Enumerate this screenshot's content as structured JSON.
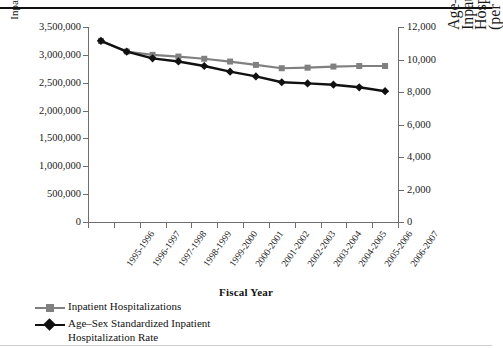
{
  "chart_data": {
    "type": "line",
    "title": "",
    "xlabel": "Fiscal Year",
    "ylabel": "Inpatient Hospitalizations",
    "ylabel_right": "Age–Sex Standardized Inpatient Hospitalization Rate (per 100,000 Population)",
    "categories": [
      "1995-1996",
      "1996-1997",
      "1997-1998",
      "1998-1999",
      "1999-2000",
      "2000-2001",
      "2001-2002",
      "2002-2003",
      "2003-2004",
      "2004-2005",
      "2005-2006",
      "2006-2007"
    ],
    "ylim": [
      0,
      3500000
    ],
    "yticks": [
      0,
      500000,
      1000000,
      1500000,
      2000000,
      2500000,
      3000000,
      3500000
    ],
    "ytick_labels": [
      "0",
      "500,000",
      "1,000,000",
      "1,500,000",
      "2,000,000",
      "2,500,000",
      "3,000,000",
      "3,500,000"
    ],
    "ylim_right": [
      0,
      12000
    ],
    "yticks_right": [
      0,
      2000,
      4000,
      6000,
      8000,
      10000,
      12000
    ],
    "ytick_labels_right": [
      "0",
      "2,000",
      "4,000",
      "6,000",
      "8,000",
      "10,000",
      "12,000"
    ],
    "grid": false,
    "legend_position": "bottom-left",
    "series": [
      {
        "name": "Inpatient Hospitalizations",
        "axis": "left",
        "color": "#808080",
        "marker": "square",
        "values": [
          3250000,
          3060000,
          3000000,
          2970000,
          2930000,
          2880000,
          2820000,
          2760000,
          2770000,
          2790000,
          2800000,
          2800000
        ]
      },
      {
        "name": "Age–Sex Standardized Inpatient Hospitalization Rate",
        "axis": "right",
        "color": "#111111",
        "marker": "diamond",
        "values": [
          11150,
          10480,
          10070,
          9880,
          9600,
          9250,
          8960,
          8600,
          8530,
          8450,
          8290,
          8050
        ]
      }
    ]
  },
  "legend": {
    "items": [
      {
        "label": "Inpatient Hospitalizations",
        "color": "#808080",
        "marker": "square"
      },
      {
        "label": "Age–Sex Standardized Inpatient",
        "label2": "Hospitalization Rate",
        "color": "#111111",
        "marker": "diamond"
      }
    ]
  },
  "axes": {
    "x_title": "Fiscal Year",
    "y_title_left": "Inpatient Hospitalizations",
    "y_title_right_line1": "Age–Sex Standardized Inpatient",
    "y_title_right_line2": "Hospitalization Rate",
    "y_title_right_line3": "(per 100,000 Population)"
  }
}
